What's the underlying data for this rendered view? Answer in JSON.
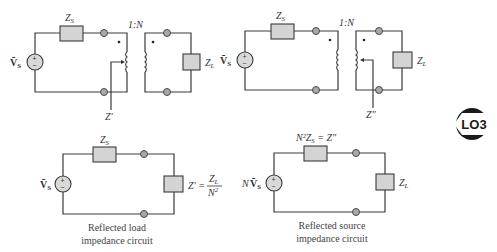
{
  "diagrams": {
    "top_left": {
      "source_label": "Ṽ",
      "source_sub": "S",
      "zs_label": "Z",
      "zs_sub": "S",
      "ratio": "1:N",
      "zl_label": "Z",
      "zl_sub": "L",
      "impedance_marker": "Z′"
    },
    "top_right": {
      "source_label": "Ṽ",
      "source_sub": "S",
      "zs_label": "Z",
      "zs_sub": "S",
      "ratio": "1:N",
      "zl_label": "Z",
      "zl_sub": "L",
      "impedance_marker": "Z″"
    },
    "bottom_left": {
      "source_label": "Ṽ",
      "source_sub": "S",
      "zs_label": "Z",
      "zs_sub": "S",
      "reflected_label": "Z′ =",
      "frac_num": "Z",
      "frac_num_sub": "L",
      "frac_den": "N",
      "frac_den_sup": "2",
      "caption_line1": "Reflected load",
      "caption_line2": "impedance circuit"
    },
    "bottom_right": {
      "source_prefix": "N",
      "source_label": "Ṽ",
      "source_sub": "S",
      "series_label": "N²Z",
      "series_sub": "S",
      "series_eq": " = Z″",
      "zl_label": "Z",
      "zl_sub": "L",
      "caption_line1": "Reflected source",
      "caption_line2": "impedance circuit"
    }
  },
  "badge": {
    "text": "LO3",
    "color": "#1a1a1a"
  },
  "colors": {
    "wire": "#3a3a3a",
    "box_fill": "#d4d4d4",
    "terminal_fill": "#a8a8a8"
  }
}
